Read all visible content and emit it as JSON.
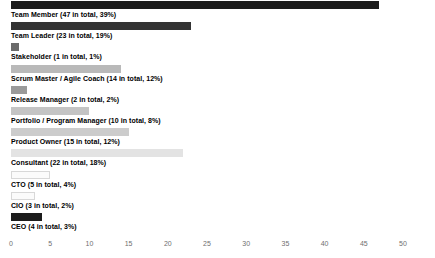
{
  "chart_data": {
    "type": "bar",
    "orientation": "horizontal",
    "title": "",
    "xlabel": "",
    "ylabel": "",
    "xlim": [
      0,
      50
    ],
    "xticks": [
      0,
      5,
      10,
      15,
      20,
      25,
      30,
      35,
      40,
      45,
      50
    ],
    "grid": false,
    "legend": "none",
    "categories": [
      "Team Member",
      "Team Leader",
      "Stakeholder",
      "Scrum Master / Agile Coach",
      "Release Manager",
      "Portfolio / Program Manager",
      "Product Owner",
      "Consultant",
      "CTO",
      "CIO",
      "CEO"
    ],
    "values": [
      47,
      23,
      1,
      14,
      2,
      10,
      15,
      22,
      5,
      3,
      4
    ],
    "percents": [
      39,
      19,
      1,
      12,
      2,
      8,
      12,
      18,
      4,
      2,
      3
    ],
    "bar_colors": [
      "#1c1c1c",
      "#333333",
      "#6b6b6b",
      "#b9b9b9",
      "#9a9a9a",
      "#c4c4c4",
      "#cccccc",
      "#e3e3e3",
      "#fbfbfb",
      "#fbfbfb",
      "#1c1c1c"
    ],
    "bars": [
      {
        "label": "Team Member (47 in total, 39%)",
        "value": 47,
        "percent": 39,
        "color": "#1c1c1c"
      },
      {
        "label": "Team Leader (23 in total, 19%)",
        "value": 23,
        "percent": 19,
        "color": "#333333"
      },
      {
        "label": "Stakeholder (1 in total, 1%)",
        "value": 1,
        "percent": 1,
        "color": "#6b6b6b"
      },
      {
        "label": "Scrum Master / Agile Coach (14 in total, 12%)",
        "value": 14,
        "percent": 12,
        "color": "#b9b9b9"
      },
      {
        "label": "Release Manager (2 in total, 2%)",
        "value": 2,
        "percent": 2,
        "color": "#9a9a9a"
      },
      {
        "label": "Portfolio / Program Manager (10 in total, 8%)",
        "value": 10,
        "percent": 8,
        "color": "#c4c4c4"
      },
      {
        "label": "Product Owner (15 in total, 12%)",
        "value": 15,
        "percent": 12,
        "color": "#cccccc"
      },
      {
        "label": "Consultant (22 in total, 18%)",
        "value": 22,
        "percent": 18,
        "color": "#e3e3e3"
      },
      {
        "label": "CTO (5 in total, 4%)",
        "value": 5,
        "percent": 4,
        "color": "#fbfbfb"
      },
      {
        "label": "CIO (3 in total, 2%)",
        "value": 3,
        "percent": 2,
        "color": "#fbfbfb"
      },
      {
        "label": "CEO (4 in total, 3%)",
        "value": 4,
        "percent": 3,
        "color": "#1c1c1c"
      }
    ]
  },
  "axis": {
    "tick_labels": [
      "0",
      "5",
      "10",
      "15",
      "20",
      "25",
      "30",
      "35",
      "40",
      "45",
      "50"
    ]
  }
}
